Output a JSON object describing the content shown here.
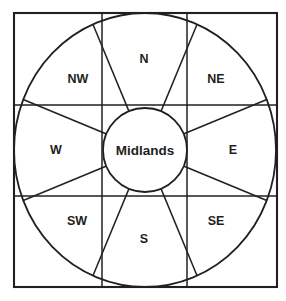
{
  "diagram": {
    "background_color": "#ffffff",
    "line_color": "#231f20",
    "center": {
      "label": "Midlands",
      "cx": 145,
      "cy": 150,
      "r": 42
    },
    "outer_square": {
      "x": 14,
      "y": 13,
      "width": 263,
      "height": 274
    },
    "outer_circle": {
      "cx": 145,
      "cy": 150,
      "rx": 131,
      "ry": 137
    },
    "grid": {
      "vertical_x": [
        102,
        187
      ],
      "horizontal_y": [
        105,
        196
      ]
    },
    "sectors": [
      {
        "id": "n",
        "label": "N",
        "angle_deg": 90,
        "label_x": 144,
        "label_y": 60
      },
      {
        "id": "ne",
        "label": "NE",
        "angle_deg": 45,
        "label_x": 216,
        "label_y": 80
      },
      {
        "id": "e",
        "label": "E",
        "angle_deg": 0,
        "label_x": 233,
        "label_y": 151
      },
      {
        "id": "se",
        "label": "SE",
        "angle_deg": -45,
        "label_x": 216,
        "label_y": 222
      },
      {
        "id": "s",
        "label": "S",
        "angle_deg": -90,
        "label_x": 144,
        "label_y": 240
      },
      {
        "id": "sw",
        "label": "SW",
        "angle_deg": 225,
        "label_x": 77,
        "label_y": 222
      },
      {
        "id": "w",
        "label": "W",
        "angle_deg": 180,
        "label_x": 56,
        "label_y": 151
      },
      {
        "id": "nw",
        "label": "NW",
        "angle_deg": 135,
        "label_x": 78,
        "label_y": 80
      }
    ],
    "spoke_angles_deg": [
      22.5,
      67.5,
      112.5,
      157.5,
      202.5,
      247.5,
      292.5,
      337.5
    ]
  }
}
